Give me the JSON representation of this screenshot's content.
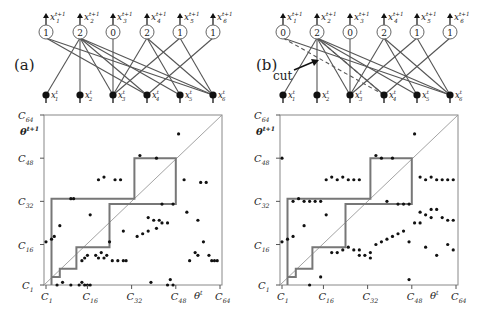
{
  "figure": {
    "panels": [
      {
        "id": "a",
        "label": "(a)",
        "offset_x": 0,
        "network": {
          "output_counts": [
            "1",
            "2",
            "0",
            "2",
            "1",
            "1"
          ],
          "output_labels": [
            "x",
            "x",
            "x",
            "x",
            "x",
            "x"
          ],
          "output_subs": [
            "1",
            "2",
            "3",
            "4",
            "5",
            "6"
          ],
          "output_sup": "t+1",
          "input_sup": "t",
          "edges": [
            [
              0,
              3
            ],
            [
              0,
              5
            ],
            [
              1,
              0
            ],
            [
              1,
              1
            ],
            [
              1,
              3
            ],
            [
              1,
              4
            ],
            [
              1,
              5
            ],
            [
              1,
              2
            ],
            [
              2,
              2
            ],
            [
              3,
              2
            ],
            [
              3,
              4
            ],
            [
              3,
              5
            ],
            [
              4,
              2
            ],
            [
              4,
              5
            ],
            [
              5,
              3
            ]
          ],
          "dashed_edges": [],
          "cut_label": null
        },
        "plot": {
          "staircase": [
            [
              3,
              1
            ],
            [
              3,
              4
            ],
            [
              6,
              4
            ],
            [
              6,
              7
            ],
            [
              12,
              7
            ],
            [
              12,
              15
            ],
            [
              24,
              15
            ],
            [
              24,
              31
            ],
            [
              48,
              31
            ],
            [
              48,
              48
            ],
            [
              33,
              48
            ],
            [
              33,
              33
            ],
            [
              3,
              33
            ],
            [
              3,
              4
            ]
          ],
          "points": [
            [
              1,
              17
            ],
            [
              3,
              18
            ],
            [
              4,
              19
            ],
            [
              6,
              23
            ],
            [
              17,
              27
            ],
            [
              10,
              33
            ],
            [
              11,
              33
            ],
            [
              20,
              40
            ],
            [
              22,
              41
            ],
            [
              26,
              40
            ],
            [
              28,
              40
            ],
            [
              35,
              49
            ],
            [
              41,
              48
            ],
            [
              49,
              57
            ],
            [
              51,
              40
            ],
            [
              57,
              39
            ],
            [
              59,
              39
            ],
            [
              43,
              31
            ],
            [
              47,
              31
            ],
            [
              52,
              28
            ],
            [
              56,
              25
            ],
            [
              38,
              26
            ],
            [
              40,
              25
            ],
            [
              42,
              25
            ],
            [
              43,
              24
            ],
            [
              34,
              19
            ],
            [
              36,
              20
            ],
            [
              38,
              21
            ],
            [
              41,
              22
            ],
            [
              45,
              24
            ],
            [
              29,
              21
            ],
            [
              24,
              17
            ],
            [
              19,
              12
            ],
            [
              20,
              11
            ],
            [
              21,
              13
            ],
            [
              23,
              12
            ],
            [
              22,
              11
            ],
            [
              25,
              10
            ],
            [
              14,
              10
            ],
            [
              15,
              11
            ],
            [
              16,
              12
            ],
            [
              27,
              10
            ],
            [
              29,
              10
            ],
            [
              30,
              10
            ],
            [
              58,
              17
            ],
            [
              55,
              13
            ],
            [
              56,
              12
            ],
            [
              60,
              12
            ],
            [
              62,
              10
            ],
            [
              63,
              10
            ],
            [
              61,
              10
            ],
            [
              53,
              10
            ],
            [
              5,
              1
            ],
            [
              7,
              2
            ],
            [
              10,
              1
            ],
            [
              13,
              1
            ],
            [
              14,
              2
            ],
            [
              16,
              1
            ],
            [
              39,
              2
            ],
            [
              45,
              1
            ],
            [
              46,
              3
            ],
            [
              47,
              1
            ],
            [
              17,
              1
            ],
            [
              15,
              1
            ]
          ]
        }
      },
      {
        "id": "b",
        "label": "(b)",
        "offset_x": 240,
        "network": {
          "output_counts": [
            "0",
            "2",
            "0",
            "2",
            "1",
            "1"
          ],
          "output_labels": [
            "x",
            "x",
            "x",
            "x",
            "x",
            "x"
          ],
          "output_subs": [
            "1",
            "2",
            "3",
            "4",
            "5",
            "6"
          ],
          "output_sup": "t+1",
          "input_sup": "t",
          "edges": [
            [
              0,
              5
            ],
            [
              1,
              0
            ],
            [
              1,
              1
            ],
            [
              1,
              3
            ],
            [
              1,
              4
            ],
            [
              1,
              5
            ],
            [
              1,
              2
            ],
            [
              2,
              2
            ],
            [
              3,
              2
            ],
            [
              3,
              4
            ],
            [
              3,
              5
            ],
            [
              4,
              2
            ],
            [
              4,
              5
            ],
            [
              5,
              3
            ]
          ],
          "dashed_edges": [
            [
              0,
              3
            ],
            [
              1,
              3
            ]
          ],
          "cut_label": "cut"
        },
        "plot": {
          "staircase": [
            [
              3,
              1
            ],
            [
              3,
              4
            ],
            [
              6,
              4
            ],
            [
              6,
              7
            ],
            [
              12,
              7
            ],
            [
              12,
              15
            ],
            [
              24,
              15
            ],
            [
              24,
              31
            ],
            [
              48,
              31
            ],
            [
              48,
              48
            ],
            [
              33,
              48
            ],
            [
              33,
              33
            ],
            [
              3,
              33
            ],
            [
              3,
              4
            ]
          ],
          "points": [
            [
              1,
              48
            ],
            [
              5,
              32
            ],
            [
              7,
              33
            ],
            [
              9,
              32
            ],
            [
              11,
              32
            ],
            [
              13,
              32
            ],
            [
              15,
              32
            ],
            [
              17,
              40
            ],
            [
              19,
              41
            ],
            [
              21,
              40
            ],
            [
              23,
              41
            ],
            [
              25,
              40
            ],
            [
              27,
              40
            ],
            [
              29,
              40
            ],
            [
              35,
              49
            ],
            [
              37,
              48
            ],
            [
              41,
              48
            ],
            [
              49,
              57
            ],
            [
              51,
              41
            ],
            [
              53,
              40
            ],
            [
              55,
              41
            ],
            [
              57,
              40
            ],
            [
              59,
              40
            ],
            [
              61,
              40
            ],
            [
              63,
              40
            ],
            [
              39,
              32
            ],
            [
              43,
              31
            ],
            [
              45,
              31
            ],
            [
              47,
              31
            ],
            [
              51,
              28
            ],
            [
              55,
              29
            ],
            [
              1,
              17
            ],
            [
              3,
              18
            ],
            [
              5,
              19
            ],
            [
              9,
              23
            ],
            [
              17,
              27
            ],
            [
              19,
              13
            ],
            [
              21,
              13
            ],
            [
              23,
              14
            ],
            [
              29,
              12
            ],
            [
              33,
              11
            ],
            [
              35,
              16
            ],
            [
              37,
              17
            ],
            [
              39,
              18
            ],
            [
              41,
              19
            ],
            [
              43,
              20
            ],
            [
              45,
              21
            ],
            [
              47,
              17
            ],
            [
              49,
              24
            ],
            [
              51,
              24
            ],
            [
              53,
              27
            ],
            [
              55,
              26
            ],
            [
              57,
              29
            ],
            [
              59,
              26
            ],
            [
              61,
              25
            ],
            [
              63,
              25
            ],
            [
              25,
              15
            ],
            [
              27,
              14
            ],
            [
              29,
              14
            ],
            [
              31,
              12
            ],
            [
              33,
              13
            ],
            [
              53,
              15
            ],
            [
              57,
              12
            ],
            [
              61,
              16
            ],
            [
              63,
              14
            ],
            [
              11,
              1
            ],
            [
              15,
              4
            ],
            [
              47,
              3
            ]
          ]
        },
        "cut": {
          "text": "cut"
        }
      }
    ],
    "axes": {
      "x_ticks": [
        "C",
        "C",
        "C",
        "C",
        "C"
      ],
      "x_tick_subs": [
        "1",
        "16",
        "32",
        "48",
        "64"
      ],
      "y_ticks": [
        "C",
        "C",
        "C",
        "C",
        "C"
      ],
      "y_tick_subs": [
        "1",
        "16",
        "32",
        "48",
        "64"
      ],
      "x_label": "θ",
      "x_label_sup": "t",
      "y_label": "θ",
      "y_label_sup": "t+1"
    },
    "colors": {
      "line": "#555555",
      "staircase": "#777777",
      "diagonal": "#999999",
      "point": "#111111",
      "frame": "#888888"
    }
  }
}
